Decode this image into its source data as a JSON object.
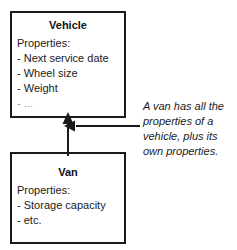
{
  "diagram": {
    "type": "uml-class-inheritance",
    "classes": [
      {
        "id": "vehicle",
        "name": "Vehicle",
        "properties_label": "Properties:",
        "properties": [
          {
            "text": "- Next service date",
            "faint": false
          },
          {
            "text": "- Wheel size",
            "faint": false
          },
          {
            "text": "- Weight",
            "faint": false
          },
          {
            "text": "- ...",
            "faint": true
          }
        ]
      },
      {
        "id": "van",
        "name": "Van",
        "properties_label": "Properties:",
        "properties": [
          {
            "text": "- Storage capacity",
            "faint": false
          },
          {
            "text": "- etc.",
            "faint": false
          }
        ]
      }
    ],
    "relationship": {
      "kind": "generalization",
      "from": "van",
      "to": "vehicle",
      "arrow_direction": "up"
    },
    "annotation": {
      "lines": [
        "A van has all the",
        "properties of a",
        "vehicle, plus its",
        "own properties."
      ],
      "arrow_direction": "left",
      "style": "italic"
    },
    "colors": {
      "stroke": "#1a1a1a",
      "text": "#1a1a1a",
      "faint_text": "#9a9a9a",
      "background": "#ffffff"
    }
  }
}
